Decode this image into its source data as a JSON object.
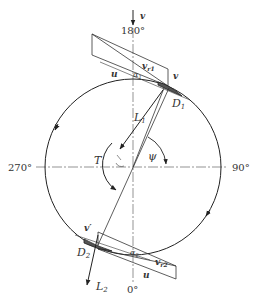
{
  "angles": {
    "top": "180°",
    "bottom": "0°",
    "left": "270°",
    "right": "90°"
  },
  "labels": {
    "v_top": "v",
    "v_upper": "v",
    "u_upper": "u",
    "vr1": "v",
    "vr1_sub": "r1",
    "alpha1": "α",
    "alpha1_sub": "1",
    "D1": "D",
    "D1_sub": "1",
    "L1": "L",
    "L1_sub": "1",
    "T": "T",
    "psi": "ψ",
    "v_prime": "v′",
    "D2": "D",
    "D2_sub": "2",
    "alpha2": "α",
    "alpha2_sub": "2",
    "vr2": "v",
    "vr2_sub": "r2",
    "u_lower": "u",
    "L2": "L",
    "L2_sub": "2"
  }
}
